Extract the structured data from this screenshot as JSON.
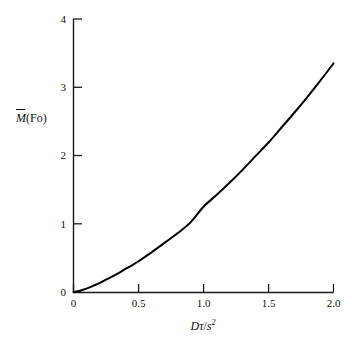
{
  "chart_data": {
    "type": "line",
    "title": "",
    "subtitle": "",
    "xlabel": "Dτ/s²",
    "ylabel": "M̄(Fo)",
    "xlim": [
      0,
      2.0
    ],
    "ylim": [
      0,
      4
    ],
    "grid": false,
    "legend": null,
    "xticks": [
      0,
      0.5,
      1.0,
      1.5,
      2.0
    ],
    "xtick_labels": [
      "0",
      "0.5",
      "1.0",
      "1.5",
      "2.0"
    ],
    "yticks": [
      0,
      1,
      2,
      3,
      4
    ],
    "ytick_labels": [
      "0",
      "1",
      "2",
      "3",
      "4"
    ],
    "tick_direction": "in",
    "series": [
      {
        "name": "M̄(Fo)",
        "color": "#000000",
        "line_width": 2,
        "x": [
          0.0,
          0.05,
          0.1,
          0.15,
          0.2,
          0.25,
          0.3,
          0.35,
          0.4,
          0.45,
          0.5,
          0.6,
          0.7,
          0.8,
          0.9,
          1.0,
          1.1,
          1.2,
          1.3,
          1.4,
          1.5,
          1.6,
          1.7,
          1.8,
          1.9,
          2.0
        ],
        "values": [
          0.0,
          0.02,
          0.05,
          0.09,
          0.13,
          0.18,
          0.23,
          0.28,
          0.34,
          0.39,
          0.45,
          0.58,
          0.72,
          0.86,
          1.02,
          1.25,
          1.42,
          1.6,
          1.79,
          1.99,
          2.19,
          2.41,
          2.63,
          2.86,
          3.1,
          3.35
        ]
      }
    ],
    "annotations": []
  },
  "axis_titles": {
    "y_main": "M",
    "y_suffix": "(Fo)",
    "x_numerator_d": "D",
    "x_numerator_tau": "τ",
    "x_slash": "/",
    "x_denominator": "s",
    "x_exponent": "2"
  },
  "colors": {
    "background": "#ffffff",
    "axis": "#1a1a1a",
    "curve": "#000000",
    "text": "#111111"
  }
}
